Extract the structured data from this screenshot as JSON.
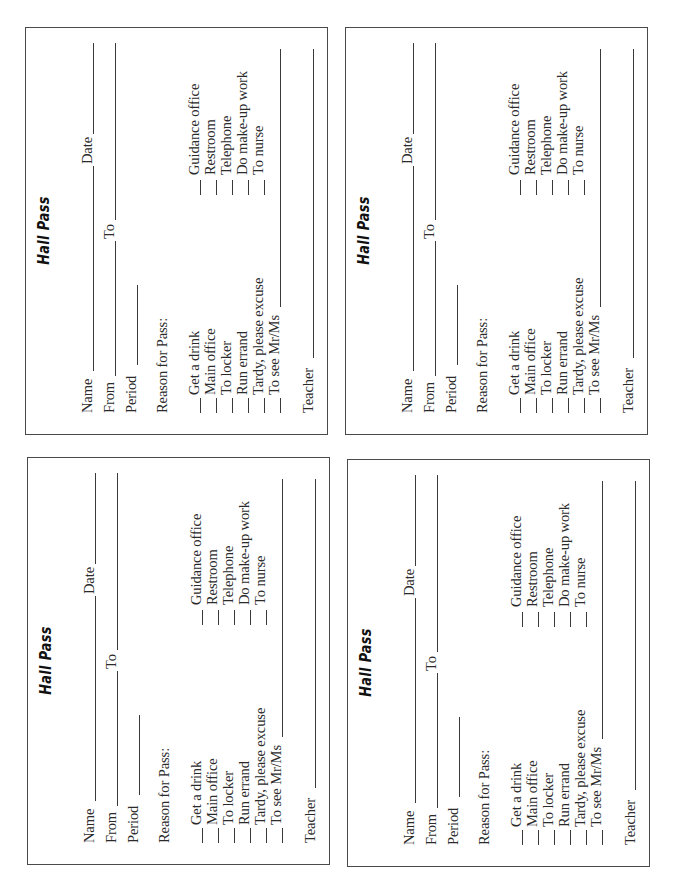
{
  "layout": {
    "cards_count": 4,
    "orientation": "rotated-90-ccw"
  },
  "pass": {
    "title": "Hall Pass",
    "fields": {
      "name": "Name",
      "date": "Date",
      "from": "From",
      "to": "To",
      "period": "Period",
      "reason": "Reason for Pass:",
      "teacher": "Teacher"
    },
    "reasons_left": [
      "Get a drink",
      "Main office",
      "To locker",
      "Run errand",
      "Tardy, please excuse",
      "To see Mr/Ms"
    ],
    "reasons_right": [
      "Guidance office",
      "Restroom",
      "Telephone",
      "Do make-up work",
      "To nurse"
    ]
  },
  "cards": [
    {
      "id": "top-left"
    },
    {
      "id": "top-right"
    },
    {
      "id": "bottom-left"
    },
    {
      "id": "bottom-right"
    }
  ]
}
